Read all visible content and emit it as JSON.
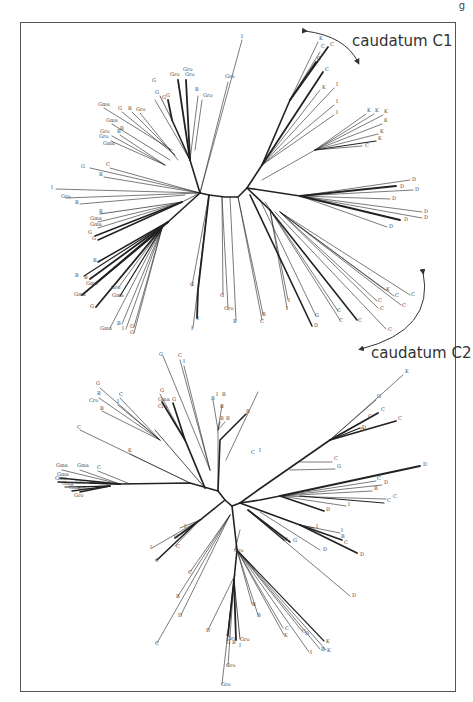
{
  "figure": {
    "corner_fragment": "g",
    "annotations": {
      "c1": "caudatum C1",
      "c2": "caudatum C2"
    },
    "colors": {
      "line": "#222222",
      "thin": "#777777",
      "frame": "#555555",
      "text": "#333333"
    }
  },
  "tree_top": {
    "labels": [
      {
        "t": "I",
        "x": 241,
        "y": 38
      },
      {
        "t": "Gro",
        "x": 225,
        "y": 78
      },
      {
        "t": "Gro",
        "x": 183,
        "y": 71
      },
      {
        "t": "Gro",
        "x": 170,
        "y": 76
      },
      {
        "t": "Gro",
        "x": 185,
        "y": 76
      },
      {
        "t": "G",
        "x": 152,
        "y": 82
      },
      {
        "t": "B",
        "x": 195,
        "y": 91
      },
      {
        "t": "Gro",
        "x": 203,
        "y": 97
      },
      {
        "t": "G",
        "x": 155,
        "y": 94
      },
      {
        "t": "G",
        "x": 162,
        "y": 99
      },
      {
        "t": "G",
        "x": 166,
        "y": 97
      },
      {
        "t": "Gma",
        "x": 98,
        "y": 106
      },
      {
        "t": "G",
        "x": 118,
        "y": 110
      },
      {
        "t": "B",
        "x": 128,
        "y": 110
      },
      {
        "t": "Gro",
        "x": 136,
        "y": 111
      },
      {
        "t": "Gma",
        "x": 106,
        "y": 122
      },
      {
        "t": "Gro",
        "x": 100,
        "y": 133
      },
      {
        "t": "B",
        "x": 117,
        "y": 133
      },
      {
        "t": "B",
        "x": 120,
        "y": 130
      },
      {
        "t": "Gro",
        "x": 99,
        "y": 138
      },
      {
        "t": "Gma",
        "x": 103,
        "y": 145
      },
      {
        "t": "G",
        "x": 81,
        "y": 168
      },
      {
        "t": "C",
        "x": 106,
        "y": 166
      },
      {
        "t": "B",
        "x": 99,
        "y": 176
      },
      {
        "t": "I",
        "x": 51,
        "y": 189
      },
      {
        "t": "Gro",
        "x": 61,
        "y": 198
      },
      {
        "t": "B",
        "x": 75,
        "y": 204
      },
      {
        "t": "B",
        "x": 99,
        "y": 213
      },
      {
        "t": "Gma",
        "x": 90,
        "y": 220
      },
      {
        "t": "Gma",
        "x": 90,
        "y": 226
      },
      {
        "t": "G",
        "x": 88,
        "y": 234
      },
      {
        "t": "G",
        "x": 92,
        "y": 240
      },
      {
        "t": "B",
        "x": 93,
        "y": 262
      },
      {
        "t": "B",
        "x": 75,
        "y": 277
      },
      {
        "t": "B",
        "x": 84,
        "y": 279
      },
      {
        "t": "Gma",
        "x": 86,
        "y": 285
      },
      {
        "t": "Gro",
        "x": 111,
        "y": 289
      },
      {
        "t": "Gma",
        "x": 74,
        "y": 296
      },
      {
        "t": "Gma",
        "x": 112,
        "y": 297
      },
      {
        "t": "G",
        "x": 90,
        "y": 308
      },
      {
        "t": "B",
        "x": 117,
        "y": 325
      },
      {
        "t": "Gma",
        "x": 100,
        "y": 330
      },
      {
        "t": "I",
        "x": 122,
        "y": 330
      },
      {
        "t": "G",
        "x": 130,
        "y": 328
      },
      {
        "t": "G",
        "x": 130,
        "y": 334
      },
      {
        "t": "G",
        "x": 190,
        "y": 286
      },
      {
        "t": "I",
        "x": 191,
        "y": 330
      },
      {
        "t": "I",
        "x": 197,
        "y": 320
      },
      {
        "t": "G",
        "x": 220,
        "y": 297
      },
      {
        "t": "Gro",
        "x": 224,
        "y": 310
      },
      {
        "t": "B",
        "x": 233,
        "y": 323
      },
      {
        "t": "B",
        "x": 262,
        "y": 316
      },
      {
        "t": "C",
        "x": 260,
        "y": 323
      },
      {
        "t": "I",
        "x": 288,
        "y": 302
      },
      {
        "t": "I",
        "x": 286,
        "y": 310
      },
      {
        "t": "G",
        "x": 315,
        "y": 317
      },
      {
        "t": "D",
        "x": 314,
        "y": 327
      },
      {
        "t": "C",
        "x": 337,
        "y": 312
      },
      {
        "t": "C",
        "x": 339,
        "y": 322
      },
      {
        "t": "C",
        "x": 358,
        "y": 322
      },
      {
        "t": "C",
        "x": 388,
        "y": 331
      },
      {
        "t": "K",
        "x": 386,
        "y": 291
      },
      {
        "t": "C",
        "x": 395,
        "y": 297
      },
      {
        "t": "C",
        "x": 411,
        "y": 296
      },
      {
        "t": "C",
        "x": 378,
        "y": 302
      },
      {
        "t": "C",
        "x": 380,
        "y": 310
      },
      {
        "t": "C",
        "x": 402,
        "y": 307
      },
      {
        "t": "K",
        "x": 319,
        "y": 40
      },
      {
        "t": "C",
        "x": 321,
        "y": 48
      },
      {
        "t": "C",
        "x": 330,
        "y": 46
      },
      {
        "t": "C",
        "x": 317,
        "y": 60
      },
      {
        "t": "C",
        "x": 325,
        "y": 71
      },
      {
        "t": "K",
        "x": 322,
        "y": 89
      },
      {
        "t": "I",
        "x": 336,
        "y": 86
      },
      {
        "t": "I",
        "x": 336,
        "y": 103
      },
      {
        "t": "I",
        "x": 336,
        "y": 114
      },
      {
        "t": "K",
        "x": 367,
        "y": 112
      },
      {
        "t": "K",
        "x": 375,
        "y": 112
      },
      {
        "t": "K",
        "x": 384,
        "y": 113
      },
      {
        "t": "K",
        "x": 384,
        "y": 122
      },
      {
        "t": "K",
        "x": 380,
        "y": 133
      },
      {
        "t": "K",
        "x": 378,
        "y": 140
      },
      {
        "t": "C",
        "x": 365,
        "y": 147
      },
      {
        "t": "D",
        "x": 412,
        "y": 181
      },
      {
        "t": "D",
        "x": 400,
        "y": 188
      },
      {
        "t": "D",
        "x": 415,
        "y": 191
      },
      {
        "t": "D",
        "x": 392,
        "y": 200
      },
      {
        "t": "D",
        "x": 424,
        "y": 213
      },
      {
        "t": "D",
        "x": 424,
        "y": 219
      },
      {
        "t": "D",
        "x": 404,
        "y": 221
      },
      {
        "t": "D",
        "x": 389,
        "y": 228
      }
    ]
  },
  "tree_bottom": {
    "labels": [
      {
        "t": "G",
        "x": 159,
        "y": 356
      },
      {
        "t": "C",
        "x": 178,
        "y": 357
      },
      {
        "t": "I",
        "x": 183,
        "y": 363
      },
      {
        "t": "G",
        "x": 96,
        "y": 385
      },
      {
        "t": "B",
        "x": 97,
        "y": 395
      },
      {
        "t": "Cro",
        "x": 89,
        "y": 402
      },
      {
        "t": "C",
        "x": 119,
        "y": 396
      },
      {
        "t": "I",
        "x": 117,
        "y": 403
      },
      {
        "t": "B",
        "x": 100,
        "y": 410
      },
      {
        "t": "Gma",
        "x": 158,
        "y": 401
      },
      {
        "t": "Cro",
        "x": 158,
        "y": 408
      },
      {
        "t": "G",
        "x": 172,
        "y": 401
      },
      {
        "t": "I",
        "x": 216,
        "y": 396
      },
      {
        "t": "B",
        "x": 211,
        "y": 400
      },
      {
        "t": "B",
        "x": 220,
        "y": 420
      },
      {
        "t": "B",
        "x": 226,
        "y": 420
      },
      {
        "t": "B",
        "x": 220,
        "y": 408
      },
      {
        "t": "B",
        "x": 246,
        "y": 413
      },
      {
        "t": "C",
        "x": 77,
        "y": 429
      },
      {
        "t": "K",
        "x": 128,
        "y": 452
      },
      {
        "t": "Gma",
        "x": 56,
        "y": 467
      },
      {
        "t": "Gma",
        "x": 77,
        "y": 467
      },
      {
        "t": "C",
        "x": 97,
        "y": 469
      },
      {
        "t": "Gma",
        "x": 57,
        "y": 476
      },
      {
        "t": "Gma",
        "x": 55,
        "y": 480
      },
      {
        "t": "Gma",
        "x": 62,
        "y": 485
      },
      {
        "t": "Gro",
        "x": 75,
        "y": 484
      },
      {
        "t": "Gma",
        "x": 69,
        "y": 489
      },
      {
        "t": "Gma",
        "x": 78,
        "y": 490
      },
      {
        "t": "Gro",
        "x": 74,
        "y": 497
      },
      {
        "t": "G",
        "x": 160,
        "y": 392
      },
      {
        "t": "B",
        "x": 222,
        "y": 396
      },
      {
        "t": "C",
        "x": 251,
        "y": 454
      },
      {
        "t": "I",
        "x": 259,
        "y": 452
      },
      {
        "t": "K",
        "x": 405,
        "y": 373
      },
      {
        "t": "G",
        "x": 377,
        "y": 398
      },
      {
        "t": "C",
        "x": 381,
        "y": 411
      },
      {
        "t": "C",
        "x": 368,
        "y": 418
      },
      {
        "t": "D",
        "x": 362,
        "y": 429
      },
      {
        "t": "C",
        "x": 398,
        "y": 420
      },
      {
        "t": "D",
        "x": 360,
        "y": 431
      },
      {
        "t": "C",
        "x": 334,
        "y": 460
      },
      {
        "t": "G",
        "x": 337,
        "y": 468
      },
      {
        "t": "D",
        "x": 423,
        "y": 466
      },
      {
        "t": "C",
        "x": 377,
        "y": 480
      },
      {
        "t": "D",
        "x": 384,
        "y": 484
      },
      {
        "t": "B",
        "x": 374,
        "y": 490
      },
      {
        "t": "C",
        "x": 393,
        "y": 498
      },
      {
        "t": "C",
        "x": 387,
        "y": 502
      },
      {
        "t": "I",
        "x": 348,
        "y": 506
      },
      {
        "t": "D",
        "x": 326,
        "y": 511
      },
      {
        "t": "I",
        "x": 316,
        "y": 528
      },
      {
        "t": "D",
        "x": 323,
        "y": 551
      },
      {
        "t": "I",
        "x": 341,
        "y": 532
      },
      {
        "t": "B",
        "x": 341,
        "y": 538
      },
      {
        "t": "C",
        "x": 344,
        "y": 544
      },
      {
        "t": "D",
        "x": 360,
        "y": 556
      },
      {
        "t": "B",
        "x": 284,
        "y": 541
      },
      {
        "t": "G",
        "x": 293,
        "y": 542
      },
      {
        "t": "I",
        "x": 184,
        "y": 528
      },
      {
        "t": "G",
        "x": 174,
        "y": 538
      },
      {
        "t": "I",
        "x": 150,
        "y": 549
      },
      {
        "t": "C",
        "x": 176,
        "y": 548
      },
      {
        "t": "C",
        "x": 155,
        "y": 562
      },
      {
        "t": "C",
        "x": 188,
        "y": 574
      },
      {
        "t": "B",
        "x": 176,
        "y": 598
      },
      {
        "t": "D",
        "x": 178,
        "y": 617
      },
      {
        "t": "C",
        "x": 155,
        "y": 645
      },
      {
        "t": "Gro",
        "x": 234,
        "y": 552
      },
      {
        "t": "D",
        "x": 352,
        "y": 597
      },
      {
        "t": "D",
        "x": 305,
        "y": 635
      },
      {
        "t": "B",
        "x": 252,
        "y": 606
      },
      {
        "t": "B",
        "x": 257,
        "y": 617
      },
      {
        "t": "C",
        "x": 285,
        "y": 630
      },
      {
        "t": "K",
        "x": 284,
        "y": 637
      },
      {
        "t": "C",
        "x": 302,
        "y": 633
      },
      {
        "t": "K",
        "x": 326,
        "y": 643
      },
      {
        "t": "B",
        "x": 321,
        "y": 651
      },
      {
        "t": "K",
        "x": 327,
        "y": 652
      },
      {
        "t": "I",
        "x": 310,
        "y": 654
      },
      {
        "t": "D",
        "x": 206,
        "y": 632
      },
      {
        "t": "G",
        "x": 226,
        "y": 637
      },
      {
        "t": "G",
        "x": 226,
        "y": 644
      },
      {
        "t": "Gro",
        "x": 227,
        "y": 640
      },
      {
        "t": "B",
        "x": 232,
        "y": 644
      },
      {
        "t": "Gro",
        "x": 240,
        "y": 641
      },
      {
        "t": "I",
        "x": 239,
        "y": 647
      },
      {
        "t": "Gro",
        "x": 226,
        "y": 667
      },
      {
        "t": "Gro",
        "x": 221,
        "y": 686
      }
    ]
  }
}
